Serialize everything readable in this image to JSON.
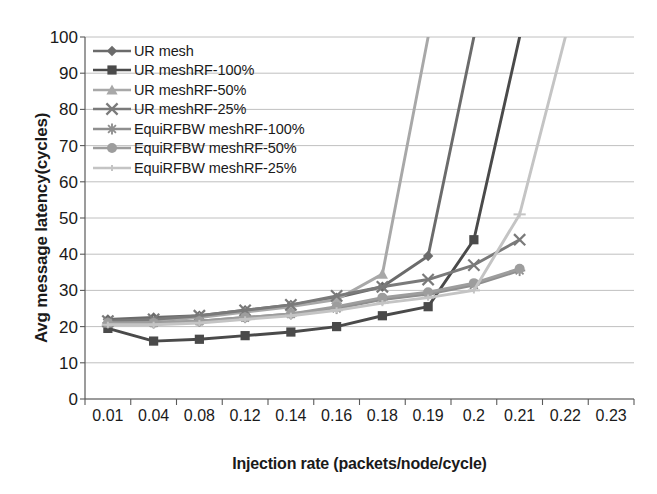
{
  "chart_data": {
    "type": "line",
    "title": "",
    "xlabel": "Injection rate (packets/node/cycle)",
    "ylabel": "Avg message latency(cycles)",
    "categories": [
      "0.01",
      "0.04",
      "0.08",
      "0.12",
      "0.14",
      "0.16",
      "0.18",
      "0.19",
      "0.2",
      "0.21",
      "0.22",
      "0.23"
    ],
    "ylim": [
      0,
      100
    ],
    "yticks": [
      0,
      10,
      20,
      30,
      40,
      50,
      60,
      70,
      80,
      90,
      100
    ],
    "grid": true,
    "legend_position": "top-left-inside",
    "note": "Curves that exceed the 100-cycle axis limit are clipped at the top of the plot area; trailing categories with no data are left blank.",
    "series": [
      {
        "name": "UR mesh",
        "marker": "diamond",
        "color": "#6b6b6b",
        "values": [
          22,
          22.5,
          23,
          24.5,
          26,
          28,
          31,
          39.5,
          100,
          null,
          null,
          null
        ]
      },
      {
        "name": "UR meshRF-100%",
        "marker": "square",
        "color": "#4a4a4a",
        "values": [
          19.5,
          16,
          16.5,
          17.5,
          18.5,
          20,
          23,
          25.5,
          44,
          100,
          null,
          null
        ]
      },
      {
        "name": "UR meshRF-50%",
        "marker": "triangle",
        "color": "#a8a8a8",
        "values": [
          21,
          21.5,
          22.5,
          24,
          25.5,
          27.5,
          34.5,
          100,
          null,
          null,
          null,
          null
        ]
      },
      {
        "name": "UR meshRF-25%",
        "marker": "x",
        "color": "#7a7a7a",
        "values": [
          21.5,
          22,
          23,
          24.5,
          26,
          28.5,
          31,
          33,
          37,
          44,
          null,
          null
        ]
      },
      {
        "name": "EquiRFBW meshRF-100%",
        "marker": "asterisk",
        "color": "#8f8f8f",
        "values": [
          21,
          21,
          21.5,
          22.5,
          23.5,
          25,
          27.5,
          29,
          31.5,
          35.5,
          null,
          null
        ]
      },
      {
        "name": "EquiRFBW meshRF-50%",
        "marker": "circle",
        "color": "#9d9d9d",
        "values": [
          21,
          21,
          21.5,
          22.5,
          23.5,
          25.5,
          28,
          29.5,
          32,
          36,
          null,
          null
        ]
      },
      {
        "name": "EquiRFBW meshRF-25%",
        "marker": "plus",
        "color": "#c4c4c4",
        "values": [
          20.5,
          20.5,
          21,
          22,
          23,
          24.5,
          26.5,
          28,
          30,
          51,
          100,
          null
        ]
      }
    ]
  },
  "legend": {
    "items": [
      {
        "label": "UR mesh"
      },
      {
        "label": "UR meshRF-100%"
      },
      {
        "label": "UR meshRF-50%"
      },
      {
        "label": "UR meshRF-25%"
      },
      {
        "label": "EquiRFBW meshRF-100%"
      },
      {
        "label": "EquiRFBW meshRF-50%"
      },
      {
        "label": "EquiRFBW meshRF-25%"
      }
    ]
  },
  "axes": {
    "gridline_color": "#b9b9b9",
    "axis_color": "#5a5a5a"
  }
}
